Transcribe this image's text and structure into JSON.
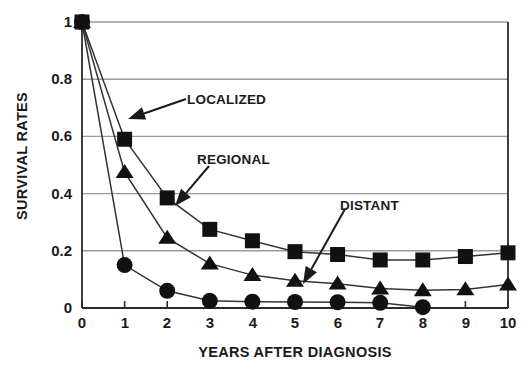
{
  "chart_data": {
    "type": "line",
    "title": "",
    "xlabel": "YEARS AFTER DIAGNOSIS",
    "ylabel": "SURVIVAL RATES",
    "x": [
      0,
      1,
      2,
      3,
      4,
      5,
      6,
      7,
      8,
      9,
      10
    ],
    "xlim": [
      0,
      10
    ],
    "ylim": [
      0,
      1
    ],
    "xticks": [
      "0",
      "1",
      "2",
      "3",
      "4",
      "5",
      "6",
      "7",
      "8",
      "9",
      "10"
    ],
    "yticks": [
      "0",
      "0.2",
      "0.4",
      "0.6",
      "0.8",
      "1"
    ],
    "ytick_values": [
      0,
      0.2,
      0.4,
      0.6,
      0.8,
      1
    ],
    "grid": "horizontal",
    "legend_position": "inline-annotations",
    "series": [
      {
        "name": "LOCALIZED",
        "marker": "square",
        "color": "#111111",
        "values": [
          1.0,
          0.59,
          0.385,
          0.275,
          0.235,
          0.197,
          0.187,
          0.168,
          0.168,
          0.18,
          0.193
        ]
      },
      {
        "name": "REGIONAL",
        "marker": "triangle",
        "color": "#111111",
        "values": [
          1.0,
          0.475,
          0.245,
          0.155,
          0.115,
          0.095,
          0.085,
          0.068,
          0.062,
          0.065,
          0.082
        ]
      },
      {
        "name": "DISTANT",
        "marker": "circle",
        "color": "#111111",
        "values": [
          1.0,
          0.15,
          0.06,
          0.025,
          0.022,
          0.021,
          0.02,
          0.018,
          0.003,
          null,
          null
        ]
      }
    ],
    "annotations": [
      {
        "text": "LOCALIZED",
        "points_to_series": "LOCALIZED"
      },
      {
        "text": "REGIONAL",
        "points_to_series": "REGIONAL"
      },
      {
        "text": "DISTANT",
        "points_to_series": "DISTANT"
      }
    ]
  },
  "axes": {
    "ylabel": "SURVIVAL RATES",
    "xlabel": "YEARS AFTER DIAGNOSIS",
    "ytick_0": "0",
    "ytick_1": "0.2",
    "ytick_2": "0.4",
    "ytick_3": "0.6",
    "ytick_4": "0.8",
    "ytick_5": "1",
    "xtick_0": "0",
    "xtick_1": "1",
    "xtick_2": "2",
    "xtick_3": "3",
    "xtick_4": "4",
    "xtick_5": "5",
    "xtick_6": "6",
    "xtick_7": "7",
    "xtick_8": "8",
    "xtick_9": "9",
    "xtick_10": "10"
  },
  "annotations": {
    "localized": "LOCALIZED",
    "regional": "REGIONAL",
    "distant": "DISTANT"
  },
  "colors": {
    "marker": "#111111",
    "line": "#333333",
    "grid": "#9a9a9a",
    "axis": "#2b2b2b",
    "background": "#ffffff"
  }
}
